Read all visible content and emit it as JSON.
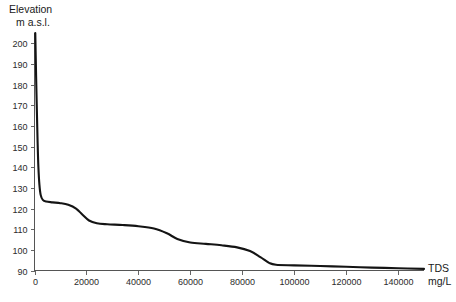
{
  "chart_data": {
    "type": "line",
    "title": "",
    "ylabel": "Elevation\nm a.s.l.",
    "ylabel_line1": "Elevation",
    "ylabel_line2": "m a.s.l.",
    "xlabel": "TDS\nmg/L",
    "xlabel_line1": "TDS",
    "xlabel_line2": "mg/L",
    "xlim": [
      0,
      150000
    ],
    "ylim": [
      90,
      205
    ],
    "xticks": [
      0,
      20000,
      40000,
      60000,
      80000,
      100000,
      120000,
      140000
    ],
    "xtick_labels": [
      "0",
      "20000",
      "40000",
      "60000",
      "80000",
      "100000",
      "120000",
      "140000"
    ],
    "yticks": [
      90,
      100,
      110,
      120,
      130,
      140,
      150,
      160,
      170,
      180,
      190,
      200
    ],
    "ytick_labels": [
      "90",
      "100",
      "110",
      "120",
      "130",
      "140",
      "150",
      "160",
      "170",
      "180",
      "190",
      "200"
    ],
    "grid": false,
    "legend": false,
    "series": [
      {
        "name": "Elevation vs TDS",
        "color": "#141414",
        "points": [
          [
            300,
            205.0
          ],
          [
            600,
            185.0
          ],
          [
            900,
            168.0
          ],
          [
            1200,
            152.0
          ],
          [
            1500,
            140.0
          ],
          [
            1900,
            131.5
          ],
          [
            2400,
            126.5
          ],
          [
            3200,
            124.2
          ],
          [
            4500,
            123.4
          ],
          [
            7000,
            123.0
          ],
          [
            10000,
            122.6
          ],
          [
            13000,
            121.8
          ],
          [
            16000,
            120.0
          ],
          [
            18500,
            117.0
          ],
          [
            21000,
            114.2
          ],
          [
            24000,
            112.9
          ],
          [
            28000,
            112.4
          ],
          [
            34000,
            112.0
          ],
          [
            40000,
            111.4
          ],
          [
            46000,
            110.3
          ],
          [
            51000,
            108.0
          ],
          [
            55000,
            105.3
          ],
          [
            60000,
            103.6
          ],
          [
            66000,
            102.9
          ],
          [
            72000,
            102.2
          ],
          [
            78000,
            101.2
          ],
          [
            83000,
            99.4
          ],
          [
            87000,
            96.5
          ],
          [
            90500,
            93.6
          ],
          [
            93000,
            92.8
          ],
          [
            100000,
            92.5
          ],
          [
            110000,
            92.2
          ],
          [
            120000,
            91.8
          ],
          [
            130000,
            91.4
          ],
          [
            140000,
            91.1
          ],
          [
            150000,
            90.8
          ]
        ]
      }
    ]
  }
}
